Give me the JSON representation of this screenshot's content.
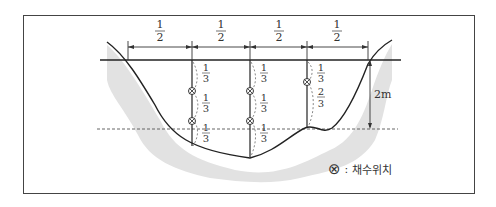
{
  "diagram": {
    "type": "river-cross-section-sampling-positions",
    "colors": {
      "frame": "#444444",
      "riverbed_fill": "#e2e2e2",
      "line": "#222222",
      "dashed": "#555555"
    },
    "width_divisions": [
      {
        "label_num": "1",
        "label_den": "2"
      },
      {
        "label_num": "1",
        "label_den": "2"
      },
      {
        "label_num": "1",
        "label_den": "2"
      },
      {
        "label_num": "1",
        "label_den": "2"
      }
    ],
    "verticals": [
      {
        "depth_fractions": [
          {
            "num": "1",
            "den": "3"
          },
          {
            "num": "1",
            "den": "3"
          },
          {
            "num": "1",
            "den": "3"
          }
        ],
        "samples": 2
      },
      {
        "depth_fractions": [
          {
            "num": "1",
            "den": "3"
          },
          {
            "num": "1",
            "den": "3"
          },
          {
            "num": "1",
            "den": "3"
          }
        ],
        "samples": 2
      },
      {
        "depth_fractions": [
          {
            "num": "1",
            "den": "3"
          },
          {
            "num": "2",
            "den": "3"
          }
        ],
        "samples": 1
      }
    ],
    "depth_label": "2m",
    "legend": {
      "symbol": "⊗",
      "separator": ":",
      "label": "채수위치"
    }
  }
}
